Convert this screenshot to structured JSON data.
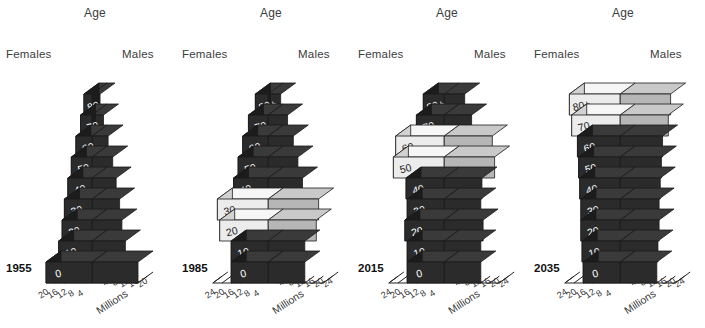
{
  "figure": {
    "background": "#ffffff",
    "common_labels": {
      "age": "Age",
      "females": "Females",
      "males": "Males",
      "units": "Millions"
    },
    "colors": {
      "dark_front": "#2b2b2b",
      "dark_top": "#3a3a3a",
      "dark_side": "#1c1c1c",
      "dark_male_front": "#2b2b2b",
      "dark_male_top": "#3a3a3a",
      "light_front": "#ececec",
      "light_top": "#f6f6f6",
      "light_side": "#d2d2d2",
      "light_male_front": "#b6b6b6",
      "light_male_top": "#c9c9c9",
      "outline": "#1a1a1a",
      "text_label": "#3c3c3c",
      "bar_text": "#ffffff",
      "bar_text_dark": "#222222"
    },
    "age_groups": [
      "0",
      "10",
      "20",
      "30",
      "40",
      "50",
      "60",
      "70",
      "80+"
    ]
  },
  "chart_data": {
    "type": "bar",
    "title": "",
    "subtitle": "",
    "xlabel": "Millions",
    "ylabel": "Age",
    "grid": false,
    "legend": "",
    "orientation": "population-pyramid-3d",
    "panels": [
      {
        "year": "1955",
        "axis_ticks_females": [
          "20",
          "16",
          "12",
          "8",
          "4"
        ],
        "axis_ticks_males": [
          "4",
          "8",
          "12",
          "16",
          "20"
        ],
        "axis_max": 20,
        "categories": [
          "0",
          "10",
          "20",
          "30",
          "40",
          "50",
          "60",
          "70",
          "80+"
        ],
        "series": [
          {
            "name": "Females",
            "values": [
              20.0,
              14.5,
              13.0,
              12.0,
              10.5,
              9.0,
              7.0,
              5.0,
              3.5
            ]
          },
          {
            "name": "Males",
            "values": [
              20.0,
              14.5,
              13.0,
              12.0,
              10.5,
              9.0,
              7.0,
              5.0,
              3.5
            ]
          }
        ],
        "highlighted_groups": []
      },
      {
        "year": "1985",
        "axis_ticks_females": [
          "24",
          "20",
          "16",
          "12",
          "8",
          "4"
        ],
        "axis_ticks_males": [
          "4",
          "8",
          "12",
          "16",
          "20",
          "24"
        ],
        "axis_max": 24,
        "categories": [
          "0",
          "10",
          "20",
          "30",
          "40",
          "50",
          "60",
          "70",
          "80+"
        ],
        "series": [
          {
            "name": "Females",
            "values": [
              16.0,
              16.0,
              21.0,
              22.0,
              15.0,
              13.0,
              11.0,
              8.5,
              5.5
            ]
          },
          {
            "name": "Males",
            "values": [
              16.0,
              16.0,
              21.0,
              22.0,
              15.0,
              13.0,
              11.0,
              8.5,
              5.5
            ]
          }
        ],
        "highlighted_groups": [
          "20",
          "30"
        ]
      },
      {
        "year": "2015",
        "axis_ticks_females": [
          "24",
          "20",
          "16",
          "12",
          "8",
          "4"
        ],
        "axis_ticks_males": [
          "4",
          "8",
          "12",
          "16",
          "20",
          "24"
        ],
        "axis_max": 24,
        "categories": [
          "0",
          "10",
          "20",
          "30",
          "40",
          "50",
          "60",
          "70",
          "80+"
        ],
        "series": [
          {
            "name": "Females",
            "values": [
              16.0,
              16.0,
              17.0,
              16.0,
              16.5,
              22.0,
              21.0,
              12.0,
              9.0
            ]
          },
          {
            "name": "Males",
            "values": [
              16.0,
              16.0,
              17.0,
              16.0,
              16.5,
              22.0,
              21.0,
              12.0,
              9.0
            ]
          }
        ],
        "highlighted_groups": [
          "50",
          "60"
        ]
      },
      {
        "year": "2035",
        "axis_ticks_females": [
          "24",
          "20",
          "16",
          "12",
          "8",
          "4"
        ],
        "axis_ticks_males": [
          "4",
          "8",
          "12",
          "16",
          "20",
          "24"
        ],
        "axis_max": 24,
        "categories": [
          "0",
          "10",
          "20",
          "30",
          "40",
          "50",
          "60",
          "70",
          "80+"
        ],
        "series": [
          {
            "name": "Females",
            "values": [
              16.0,
              16.5,
              17.0,
              17.0,
              17.5,
              18.0,
              18.5,
              21.0,
              22.0
            ]
          },
          {
            "name": "Males",
            "values": [
              16.0,
              16.5,
              17.0,
              17.0,
              17.5,
              18.0,
              18.5,
              21.0,
              22.0
            ]
          }
        ],
        "highlighted_groups": [
          "70",
          "80+"
        ]
      }
    ]
  }
}
